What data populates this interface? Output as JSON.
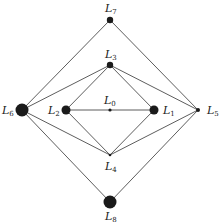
{
  "diagram": {
    "title": "",
    "nodes": [
      {
        "id": "L0",
        "label": "L",
        "sub": "0",
        "x": 110,
        "y": 110,
        "r": 1.6,
        "lx": 104,
        "ly": 104
      },
      {
        "id": "L1",
        "label": "L",
        "sub": "1",
        "x": 154,
        "y": 110,
        "r": 4.5,
        "lx": 163,
        "ly": 114
      },
      {
        "id": "L2",
        "label": "L",
        "sub": "2",
        "x": 66,
        "y": 110,
        "r": 4.5,
        "lx": 48,
        "ly": 114
      },
      {
        "id": "L3",
        "label": "L",
        "sub": "3",
        "x": 110,
        "y": 65,
        "r": 3.2,
        "lx": 105,
        "ly": 58
      },
      {
        "id": "L4",
        "label": "L",
        "sub": "4",
        "x": 110,
        "y": 155,
        "r": 1.3,
        "lx": 105,
        "ly": 170
      },
      {
        "id": "L5",
        "label": "L",
        "sub": "5",
        "x": 198,
        "y": 110,
        "r": 2.0,
        "lx": 207,
        "ly": 114
      },
      {
        "id": "L6",
        "label": "L",
        "sub": "6",
        "x": 22,
        "y": 110,
        "r": 6.5,
        "lx": 2,
        "ly": 114
      },
      {
        "id": "L7",
        "label": "L",
        "sub": "7",
        "x": 110,
        "y": 20,
        "r": 3.2,
        "lx": 105,
        "ly": 12
      },
      {
        "id": "L8",
        "label": "L",
        "sub": "8",
        "x": 110,
        "y": 202,
        "r": 6.5,
        "lx": 105,
        "ly": 220
      }
    ],
    "edges": [
      [
        "L7",
        "L6"
      ],
      [
        "L7",
        "L5"
      ],
      [
        "L3",
        "L6"
      ],
      [
        "L3",
        "L2"
      ],
      [
        "L3",
        "L1"
      ],
      [
        "L3",
        "L5"
      ],
      [
        "L2",
        "L0"
      ],
      [
        "L0",
        "L1"
      ],
      [
        "L4",
        "L6"
      ],
      [
        "L4",
        "L2"
      ],
      [
        "L4",
        "L1"
      ],
      [
        "L4",
        "L5"
      ],
      [
        "L8",
        "L6"
      ],
      [
        "L8",
        "L5"
      ]
    ]
  }
}
